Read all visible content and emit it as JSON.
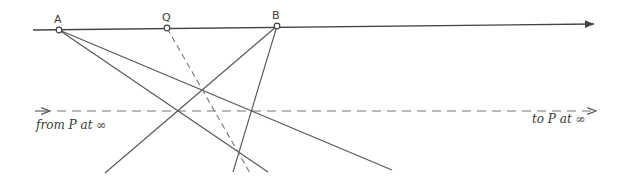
{
  "figure": {
    "width": 629,
    "height": 188,
    "stroke_color": "#555555",
    "dash_color": "#777777",
    "background": "#ffffff"
  },
  "points": {
    "A": {
      "label": "A",
      "x": 59,
      "y": 30
    },
    "Q": {
      "label": "Q",
      "x": 167,
      "y": 28
    },
    "B": {
      "label": "B",
      "x": 277,
      "y": 26
    }
  },
  "baseline": {
    "x1": 33,
    "y1": 30,
    "x2": 594,
    "y2": 24,
    "arrow": "right"
  },
  "parallel_line": {
    "y": 111,
    "x1": 35,
    "x2": 596,
    "style": "dashed",
    "arrow": "right"
  },
  "rays": [
    {
      "from": "A",
      "x2": 268,
      "y2": 172,
      "style": "solid"
    },
    {
      "from": "A",
      "x2": 392,
      "y2": 170,
      "style": "solid"
    },
    {
      "from": "B",
      "x2": 105,
      "y2": 173,
      "style": "solid"
    },
    {
      "from": "B",
      "x2": 233,
      "y2": 172,
      "style": "solid"
    },
    {
      "from": "Q",
      "x2": 250,
      "y2": 173,
      "style": "dashed"
    }
  ],
  "annotations": {
    "from_label": "from P at ∞",
    "to_label": "to P at ∞"
  }
}
